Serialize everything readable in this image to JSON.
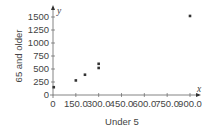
{
  "chart_data": {
    "type": "scatter",
    "title": "",
    "xlabel": "Under 5",
    "ylabel": "65 and older",
    "x_axis_var": "x",
    "y_axis_var": "y",
    "xlim": [
      0,
      950
    ],
    "ylim": [
      0,
      1600
    ],
    "x_ticks": [
      "0",
      "150.0",
      "300.0",
      "450.0",
      "600.0",
      "750.0",
      "900.0"
    ],
    "x_tick_values": [
      0,
      150,
      300,
      450,
      600,
      750,
      900
    ],
    "y_ticks": [
      "0",
      "250",
      "500",
      "750",
      "1000",
      "1250",
      "1500"
    ],
    "y_tick_values": [
      0,
      250,
      500,
      750,
      1000,
      1250,
      1500
    ],
    "grid": false,
    "legend": null,
    "points": [
      {
        "x": 5,
        "y": 150
      },
      {
        "x": 150,
        "y": 280
      },
      {
        "x": 210,
        "y": 390
      },
      {
        "x": 300,
        "y": 520
      },
      {
        "x": 300,
        "y": 600
      },
      {
        "x": 900,
        "y": 1520
      }
    ],
    "marker_color": "#333333",
    "axis_color": "#666666"
  }
}
